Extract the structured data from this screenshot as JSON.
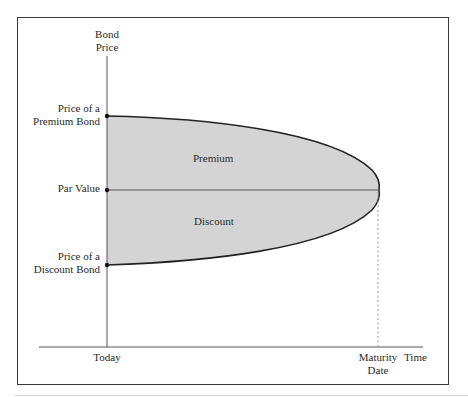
{
  "diagram": {
    "y_axis_label": [
      "Bond",
      "Price"
    ],
    "x_axis_labels": {
      "today": "Today",
      "maturity": [
        "Maturity",
        "Date"
      ],
      "time": "Time"
    },
    "y_markers": {
      "premium_price": [
        "Price of a",
        "Premium Bond"
      ],
      "par_value": "Par Value",
      "discount_price": [
        "Price of a",
        "Discount Bond"
      ]
    },
    "regions": {
      "premium": "Premium",
      "discount": "Discount"
    },
    "colors": {
      "fill": "#d4d4d4",
      "line": "#222222",
      "axis": "#555555",
      "dashed": "#999999"
    }
  }
}
